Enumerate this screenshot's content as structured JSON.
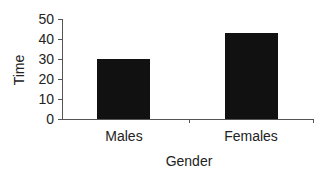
{
  "chart_data": {
    "type": "bar",
    "title": "",
    "xlabel": "Gender",
    "ylabel": "Time",
    "categories": [
      "Males",
      "Females"
    ],
    "values": [
      30,
      43
    ],
    "ylim": [
      0,
      50
    ],
    "yticks": [
      0,
      10,
      20,
      30,
      40,
      50
    ],
    "grid": false,
    "legend": null,
    "bar_color": "#111111"
  },
  "labels": {
    "yticks": [
      "0",
      "10",
      "20",
      "30",
      "40",
      "50"
    ],
    "categories": [
      "Males",
      "Females"
    ],
    "xlabel": "Gender",
    "ylabel": "Time"
  }
}
